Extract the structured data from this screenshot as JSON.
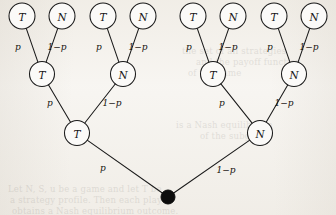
{
  "figure": {
    "background_color": "#f7f5f1",
    "ink_color": "#1a1a1a",
    "node_fill_color": "#fbfaf8",
    "root_fill_color": "#0d0d0d"
  },
  "labels": {
    "prob_left": "p",
    "prob_right": "1−p",
    "type_t": "T",
    "type_n": "N"
  },
  "tree": {
    "root": {
      "id": "root",
      "name": "root-node",
      "shape": "filled-dot",
      "label": "",
      "x": 168,
      "y": 197,
      "r": 7
    },
    "level2": [
      {
        "id": "L2-0",
        "name": "node-level2-left",
        "label": "T",
        "x": 77,
        "y": 133,
        "r": 12.5,
        "edge_label": "p",
        "edge_label_x": 103,
        "edge_label_y": 168
      },
      {
        "id": "L2-1",
        "name": "node-level2-right",
        "label": "N",
        "x": 260,
        "y": 133,
        "r": 12.5,
        "edge_label": "1−p",
        "edge_label_x": 226,
        "edge_label_y": 170
      }
    ],
    "level3": [
      {
        "id": "L3-0",
        "name": "node-level3-1",
        "label": "T",
        "x": 42,
        "y": 74,
        "r": 12.5,
        "parent": "L2-0",
        "edge_label": "p",
        "edge_label_x": 50,
        "edge_label_y": 103
      },
      {
        "id": "L3-1",
        "name": "node-level3-2",
        "label": "N",
        "x": 123,
        "y": 74,
        "r": 12.5,
        "parent": "L2-0",
        "edge_label": "1−p",
        "edge_label_x": 112,
        "edge_label_y": 103
      },
      {
        "id": "L3-2",
        "name": "node-level3-3",
        "label": "T",
        "x": 213,
        "y": 74,
        "r": 12.5,
        "parent": "L2-1",
        "edge_label": "p",
        "edge_label_x": 222,
        "edge_label_y": 103
      },
      {
        "id": "L3-3",
        "name": "node-level3-4",
        "label": "N",
        "x": 294,
        "y": 74,
        "r": 12.5,
        "parent": "L2-1",
        "edge_label": "1−p",
        "edge_label_x": 284,
        "edge_label_y": 103
      }
    ],
    "leaves": [
      {
        "id": "L4-0",
        "name": "leaf-node-1",
        "label": "T",
        "x": 22,
        "y": 16,
        "r": 13,
        "parent": "L3-0",
        "edge_label": "p",
        "edge_label_x": 18,
        "edge_label_y": 47
      },
      {
        "id": "L4-1",
        "name": "leaf-node-2",
        "label": "N",
        "x": 62,
        "y": 16,
        "r": 13,
        "parent": "L3-0",
        "edge_label": "1−p",
        "edge_label_x": 57,
        "edge_label_y": 47
      },
      {
        "id": "L4-2",
        "name": "leaf-node-3",
        "label": "T",
        "x": 103,
        "y": 16,
        "r": 13,
        "parent": "L3-1",
        "edge_label": "p",
        "edge_label_x": 99,
        "edge_label_y": 47
      },
      {
        "id": "L4-3",
        "name": "leaf-node-4",
        "label": "N",
        "x": 143,
        "y": 16,
        "r": 13,
        "parent": "L3-1",
        "edge_label": "1−p",
        "edge_label_x": 138,
        "edge_label_y": 47
      },
      {
        "id": "L4-4",
        "name": "leaf-node-5",
        "label": "T",
        "x": 193,
        "y": 16,
        "r": 13,
        "parent": "L3-2",
        "edge_label": "p",
        "edge_label_x": 189,
        "edge_label_y": 47
      },
      {
        "id": "L4-5",
        "name": "leaf-node-6",
        "label": "N",
        "x": 233,
        "y": 16,
        "r": 13,
        "parent": "L3-2",
        "edge_label": "1−p",
        "edge_label_x": 228,
        "edge_label_y": 47
      },
      {
        "id": "L4-6",
        "name": "leaf-node-7",
        "label": "T",
        "x": 274,
        "y": 16,
        "r": 13,
        "parent": "L3-3",
        "edge_label": "p",
        "edge_label_x": 270,
        "edge_label_y": 47
      },
      {
        "id": "L4-7",
        "name": "leaf-node-8",
        "label": "N",
        "x": 314,
        "y": 16,
        "r": 13,
        "parent": "L3-3",
        "edge_label": "1−p",
        "edge_label_x": 309,
        "edge_label_y": 47
      }
    ]
  },
  "ghost_text": [
    {
      "text": "the set of all strategies",
      "x": 182,
      "y": 46
    },
    {
      "text": "and the payoff function",
      "x": 196,
      "y": 57
    },
    {
      "text": "of the game",
      "x": 188,
      "y": 68
    },
    {
      "text": "is a Nash equilibrium",
      "x": 176,
      "y": 120
    },
    {
      "text": "of the subgame",
      "x": 200,
      "y": 131
    },
    {
      "text": "Let   N,  S,  u   be a game and let  T  be",
      "x": 8,
      "y": 184
    },
    {
      "text": "a strategy profile.  Then each player",
      "x": 10,
      "y": 195
    },
    {
      "text": "obtains a Nash equilibrium outcome.",
      "x": 12,
      "y": 206
    }
  ]
}
